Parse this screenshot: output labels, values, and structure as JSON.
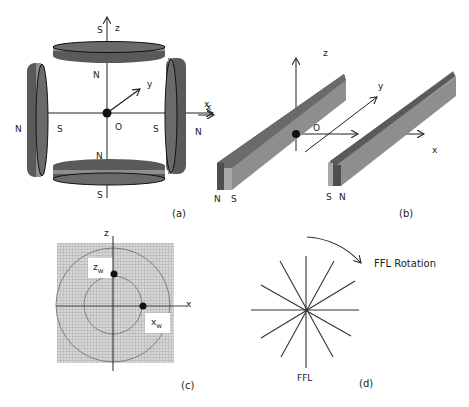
{
  "panels": {
    "a": {
      "caption": "(a)",
      "axes": {
        "x": "x",
        "y": "y",
        "z": "z",
        "origin": "O"
      },
      "poles": {
        "top_outer": "S",
        "top_inner": "N",
        "bottom_inner": "N",
        "bottom_outer": "S",
        "left_outer": "N",
        "left_inner": "S",
        "right_inner": "S",
        "right_outer": "N"
      }
    },
    "b": {
      "caption": "(b)",
      "axes": {
        "x": "x",
        "x_left": "x",
        "y": "y",
        "z": "z",
        "origin": "O"
      },
      "poles": {
        "left_bar_1": "N",
        "left_bar_2": "S",
        "right_bar_1": "S",
        "right_bar_2": "N"
      }
    },
    "c": {
      "caption": "(c)",
      "axes": {
        "x": "x",
        "z": "z"
      },
      "markers": {
        "zw_main": "z",
        "zw_sub": "w",
        "xw_main": "x",
        "xw_sub": "w"
      }
    },
    "d": {
      "caption": "(d)",
      "ffl_label": "FFL",
      "rotation_label": "FFL Rotation"
    }
  },
  "colors": {
    "magnet_dark": "#555555",
    "magnet_mid": "#8a8a8a",
    "magnet_light": "#a8a8a8",
    "grid": "#9a9a9a"
  }
}
